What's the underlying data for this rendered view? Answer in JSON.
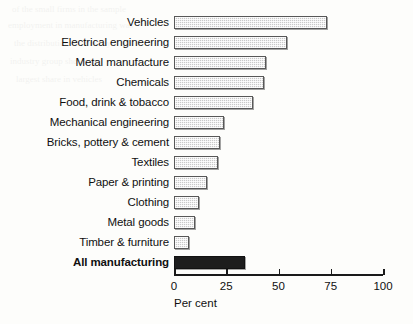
{
  "chart_data": {
    "type": "bar",
    "orientation": "horizontal",
    "title": "",
    "subtitle": "",
    "xlabel": "Per cent",
    "ylabel": "",
    "xlim": [
      0,
      100
    ],
    "grid": false,
    "legend": null,
    "ticks": [
      {
        "value": 0,
        "label": "0"
      },
      {
        "value": 25,
        "label": "25"
      },
      {
        "value": 50,
        "label": "50"
      },
      {
        "value": 75,
        "label": "75"
      },
      {
        "value": 100,
        "label": "100"
      }
    ],
    "categories": [
      "Vehicles",
      "Electrical engineering",
      "Metal manufacture",
      "Chemicals",
      "Food, drink & tobacco",
      "Mechanical engineering",
      "Bricks, pottery & cement",
      "Textiles",
      "Paper & printing",
      "Clothing",
      "Metal goods",
      "Timber & furniture",
      "All manufacturing"
    ],
    "values": [
      73,
      54,
      44,
      43,
      38,
      24,
      22,
      21,
      16,
      12,
      10,
      7,
      34
    ],
    "highlight_index": 12,
    "colors": {
      "bar_fill": "#c9c9c9",
      "bar_edge": "#585858",
      "highlight_fill": "#1d1d1d",
      "axis": "#1a1a1a",
      "text": "#101010",
      "background": "#fdfdfb"
    }
  },
  "axis": {
    "x_title": "Per cent"
  },
  "bleed_text": [
    "of the small firms in the sample",
    "employment in manufacturing was",
    "the distribution of firms by",
    "industry group shows the",
    "largest share in vehicles"
  ]
}
